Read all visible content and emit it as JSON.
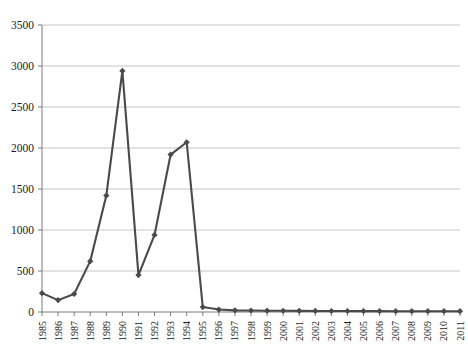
{
  "chart_data": {
    "type": "line",
    "title": "",
    "subtitle": "",
    "xlabel": "",
    "ylabel": "",
    "grid": true,
    "legend": false,
    "legend_position": "none",
    "marker": "diamond",
    "series_color": "#4a4a4a",
    "gridline_color": "#bfbfbf",
    "axis_color": "#7a7a7a",
    "xlim": [
      1985,
      2011
    ],
    "ylim": [
      0,
      3500
    ],
    "ytick_step": 500,
    "yticks": [
      0,
      500,
      1000,
      1500,
      2000,
      2500,
      3000,
      3500
    ],
    "ytick_labels": [
      "0",
      "500",
      "1000",
      "1500",
      "2000",
      "2500",
      "3000",
      "3500"
    ],
    "categories": [
      "1985",
      "1986",
      "1987",
      "1988",
      "1989",
      "1990",
      "1991",
      "1992",
      "1993",
      "1994",
      "1995",
      "1996",
      "1997",
      "1998",
      "1999",
      "2000",
      "2001",
      "2002",
      "2003",
      "2004",
      "2005",
      "2006",
      "2007",
      "2008",
      "2009",
      "2010",
      "2011"
    ],
    "values": [
      230,
      145,
      220,
      620,
      1420,
      2940,
      450,
      940,
      1920,
      2070,
      60,
      30,
      20,
      18,
      16,
      15,
      14,
      13,
      12,
      12,
      11,
      11,
      10,
      10,
      10,
      10,
      10
    ],
    "series": [
      {
        "name": "series-1",
        "color": "#4a4a4a",
        "values": [
          230,
          145,
          220,
          620,
          1420,
          2940,
          450,
          940,
          1920,
          2070,
          60,
          30,
          20,
          18,
          16,
          15,
          14,
          13,
          12,
          12,
          11,
          11,
          10,
          10,
          10,
          10,
          10
        ]
      }
    ]
  },
  "plot": {
    "left": 42,
    "right": 460,
    "top": 25,
    "bottom": 312
  }
}
